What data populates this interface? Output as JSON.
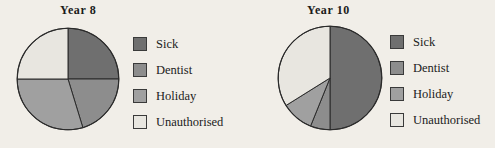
{
  "figure": {
    "background_color": "#f1eee8",
    "line_color": "#2b2b2b",
    "text_color": "#1b1b1b"
  },
  "palette": {
    "sick": "#6f6f6f",
    "dentist": "#8d8d8d",
    "holiday": "#a0a0a0",
    "unauthorised": "#e8e6e0"
  },
  "legend_common": {
    "items": [
      {
        "label": "Sick",
        "swatch": "#6f6f6f"
      },
      {
        "label": "Dentist",
        "swatch": "#8d8d8d"
      },
      {
        "label": "Holiday",
        "swatch": "#a0a0a0"
      },
      {
        "label": "Unauthorised",
        "swatch": "#e8e6e0"
      }
    ]
  },
  "charts": [
    {
      "title": "Year 8",
      "legend": {
        "items": [
          {
            "label": "Sick",
            "swatch": "#6f6f6f"
          },
          {
            "label": "Dentist",
            "swatch": "#8d8d8d"
          },
          {
            "label": "Holiday",
            "swatch": "#a0a0a0"
          },
          {
            "label": "Unauthorised",
            "swatch": "#e8e6e0"
          }
        ]
      }
    },
    {
      "title": "Year 10",
      "legend": {
        "items": [
          {
            "label": "Sick",
            "swatch": "#6f6f6f"
          },
          {
            "label": "Dentist",
            "swatch": "#8d8d8d"
          },
          {
            "label": "Holiday",
            "swatch": "#a0a0a0"
          },
          {
            "label": "Unauthorised",
            "swatch": "#e8e6e0"
          }
        ]
      }
    }
  ],
  "chart_data": [
    {
      "type": "pie",
      "title": "Year 8",
      "labels": [
        "Sick",
        "Dentist",
        "Holiday",
        "Unauthorised"
      ],
      "values": [
        25,
        20,
        30,
        25
      ],
      "unit": "percent",
      "start_angle_deg": 0,
      "direction": "clockwise",
      "slice_boundaries_deg": [
        0,
        90,
        163,
        270,
        360
      ],
      "colors": [
        "#6f6f6f",
        "#8d8d8d",
        "#a0a0a0",
        "#e8e6e0"
      ],
      "legend_position": "right",
      "grid": false,
      "xlabel": "",
      "ylabel": ""
    },
    {
      "type": "pie",
      "title": "Year 10",
      "labels": [
        "Sick",
        "Dentist",
        "Holiday",
        "Unauthorised"
      ],
      "values": [
        50,
        6,
        10,
        34
      ],
      "unit": "percent",
      "start_angle_deg": 0,
      "direction": "clockwise",
      "slice_boundaries_deg": [
        0,
        180,
        202,
        238,
        360
      ],
      "colors": [
        "#6f6f6f",
        "#8d8d8d",
        "#a0a0a0",
        "#e8e6e0"
      ],
      "legend_position": "right",
      "grid": false,
      "xlabel": "",
      "ylabel": ""
    }
  ]
}
